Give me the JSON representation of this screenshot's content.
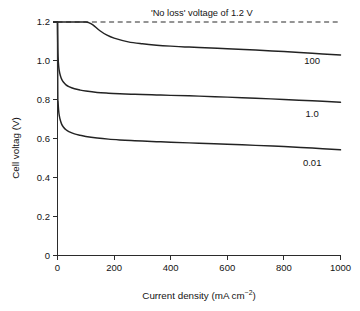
{
  "chart_data": {
    "type": "line",
    "title": "",
    "xlabel": "Current density (mA cm−2)",
    "xlabel_base": "Current density (mA cm",
    "xlabel_sup": "−2",
    "xlabel_tail": ")",
    "ylabel": "Cell voltag (V)",
    "xlim": [
      0,
      1000
    ],
    "ylim": [
      0,
      1.2
    ],
    "grid": false,
    "legend_position": "inline-right-of-curve",
    "xticks": [
      0,
      200,
      400,
      600,
      800,
      1000
    ],
    "xtick_labels": [
      "0",
      "200",
      "400",
      "600",
      "800",
      "1000"
    ],
    "yticks": [
      0,
      0.2,
      0.4,
      0.6,
      0.8,
      1.0,
      1.2
    ],
    "ytick_labels": [
      "0",
      "0.2",
      "0.4",
      "0.6",
      "0.8",
      "1.0",
      "1.2"
    ],
    "annotations": [
      {
        "name": "no-loss-voltage",
        "text": "'No loss' voltage of 1.2 V",
        "x": 330,
        "y": 1.2
      }
    ],
    "reference_lines": [
      {
        "name": "no-loss-voltage-line",
        "value": 1.2,
        "orientation": "horizontal",
        "style": "dashed",
        "color": "#2b2b2b"
      }
    ],
    "series": [
      {
        "name": "100",
        "label": "100",
        "label_x": 900,
        "label_y": 1.0,
        "color": "#232323",
        "x": [
          0,
          2,
          5,
          10,
          20,
          40,
          60,
          80,
          100,
          110,
          125,
          150,
          175,
          200,
          250,
          300,
          350,
          400,
          450,
          500,
          600,
          700,
          800,
          900,
          1000
        ],
        "y": [
          1.2,
          1.2,
          1.2,
          1.2,
          1.2,
          1.2,
          1.2,
          1.2,
          1.2,
          1.197,
          1.185,
          1.155,
          1.132,
          1.117,
          1.098,
          1.088,
          1.081,
          1.076,
          1.072,
          1.069,
          1.063,
          1.056,
          1.048,
          1.039,
          1.03
        ]
      },
      {
        "name": "1.0",
        "label": "1.0",
        "label_x": 900,
        "label_y": 0.73,
        "color": "#232323",
        "x": [
          0,
          1,
          2,
          4,
          6,
          10,
          15,
          20,
          30,
          40,
          60,
          80,
          100,
          140,
          180,
          220,
          260,
          300,
          350,
          400,
          500,
          600,
          700,
          800,
          900,
          1000
        ],
        "y": [
          1.2,
          1.07,
          1.02,
          0.975,
          0.952,
          0.925,
          0.905,
          0.893,
          0.877,
          0.868,
          0.857,
          0.85,
          0.845,
          0.838,
          0.834,
          0.831,
          0.829,
          0.827,
          0.825,
          0.823,
          0.819,
          0.814,
          0.808,
          0.802,
          0.795,
          0.788
        ]
      },
      {
        "name": "0.01",
        "label": "0.01",
        "label_x": 900,
        "label_y": 0.475,
        "color": "#232323",
        "x": [
          0,
          1,
          2,
          4,
          6,
          10,
          15,
          20,
          30,
          40,
          60,
          80,
          100,
          140,
          180,
          220,
          260,
          300,
          350,
          400,
          500,
          600,
          700,
          800,
          900,
          1000
        ],
        "y": [
          1.2,
          0.84,
          0.79,
          0.745,
          0.722,
          0.695,
          0.674,
          0.662,
          0.646,
          0.637,
          0.625,
          0.618,
          0.612,
          0.604,
          0.598,
          0.594,
          0.591,
          0.588,
          0.585,
          0.582,
          0.577,
          0.572,
          0.566,
          0.56,
          0.552,
          0.543
        ]
      }
    ]
  }
}
